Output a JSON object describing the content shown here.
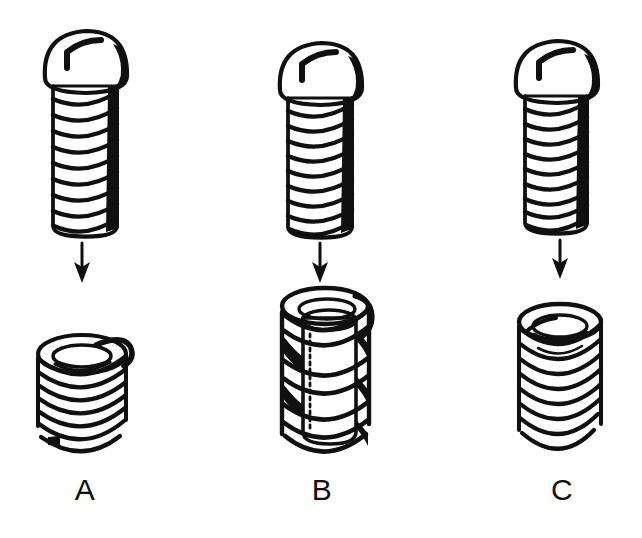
{
  "figure": {
    "background_color": "#ffffff",
    "ink_color": "#101010",
    "width": 642,
    "height": 538,
    "style": "black-and-white technical line drawing"
  },
  "columns": [
    {
      "id": "a",
      "label": "A",
      "label_x": 85,
      "label_y": 500,
      "screw": {
        "name": "slotted-round-head-screw",
        "head_type": "round head",
        "drive_type": "slotted",
        "center_x": 85,
        "head_top_y": 30,
        "shaft_bottom_y": 232,
        "shaft_half_width": 32,
        "head_half_width": 42,
        "head_height": 58,
        "thread_turns": 9,
        "shade_side": "right"
      },
      "arrow": {
        "name": "down-arrow",
        "direction": "down",
        "x": 82,
        "y_top": 243,
        "y_bottom": 282
      },
      "insert": {
        "name": "wire-thread-insert-with-tang",
        "type": "coil",
        "description": "free-standing helical wire coil insert with driving tang",
        "center_x": 82,
        "top_y": 336,
        "bottom_y": 446,
        "half_width": 47,
        "coil_turns": 8,
        "has_tang": true,
        "has_sleeve": false
      }
    },
    {
      "id": "b",
      "label": "B",
      "label_x": 322,
      "label_y": 500,
      "screw": {
        "name": "slotted-round-head-screw",
        "head_type": "round head",
        "drive_type": "slotted",
        "center_x": 320,
        "head_top_y": 42,
        "shaft_bottom_y": 232,
        "shaft_half_width": 32,
        "head_half_width": 42,
        "head_height": 58,
        "thread_turns": 9,
        "shade_side": "right"
      },
      "arrow": {
        "name": "down-arrow",
        "direction": "down",
        "x": 320,
        "y_top": 243,
        "y_bottom": 282
      },
      "insert": {
        "name": "sleeved-thread-insert",
        "type": "coil-on-sleeve",
        "description": "helical coil wound around a solid cylindrical sleeve body",
        "center_x": 325,
        "top_y": 292,
        "bottom_y": 448,
        "half_width": 47,
        "coil_turns": 4,
        "has_tang": false,
        "has_sleeve": true
      }
    },
    {
      "id": "c",
      "label": "C",
      "label_x": 562,
      "label_y": 500,
      "screw": {
        "name": "slotted-round-head-screw",
        "head_type": "round head",
        "drive_type": "slotted",
        "center_x": 558,
        "head_top_y": 40,
        "shaft_bottom_y": 228,
        "shaft_half_width": 32,
        "head_half_width": 42,
        "head_height": 58,
        "thread_turns": 9,
        "shade_side": "right"
      },
      "arrow": {
        "name": "down-arrow",
        "direction": "down",
        "x": 560,
        "y_top": 240,
        "y_bottom": 278
      },
      "insert": {
        "name": "plain-wire-thread-insert",
        "type": "coil",
        "description": "plain helical wire coil insert without tang",
        "center_x": 560,
        "top_y": 310,
        "bottom_y": 448,
        "half_width": 41,
        "coil_turns": 9,
        "has_tang": false,
        "has_sleeve": false
      }
    }
  ]
}
